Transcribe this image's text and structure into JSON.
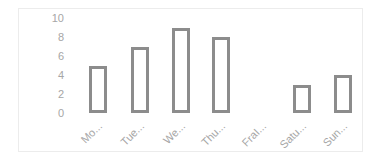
{
  "chart_data": {
    "type": "bar",
    "title": "",
    "xlabel": "",
    "ylabel": "",
    "categories": [
      "Mo...",
      "Tue...",
      "We...",
      "Thu...",
      "FraI...",
      "Satu...",
      "Sun..."
    ],
    "values": [
      5,
      7,
      9,
      8,
      0,
      3,
      4
    ],
    "ylim": [
      0,
      10
    ],
    "yticks": [
      "0",
      "2",
      "4",
      "6",
      "8",
      "10"
    ],
    "grid": false,
    "legend": null,
    "bar_style": {
      "fill": "#ffffff",
      "stroke": "#8c8c8c"
    }
  }
}
